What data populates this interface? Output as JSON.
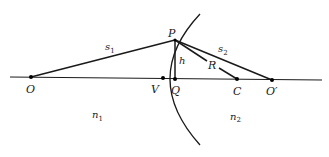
{
  "diagram": {
    "points": {
      "O": {
        "label": "O",
        "x": 31,
        "y": 77
      },
      "V": {
        "label": "V",
        "x": 163,
        "y": 78
      },
      "Q": {
        "label": "Q",
        "x": 175,
        "y": 79
      },
      "C": {
        "label": "C",
        "x": 237,
        "y": 79
      },
      "Oprime": {
        "label": "O′",
        "x": 272,
        "y": 80
      },
      "P": {
        "label": "P",
        "x": 175,
        "y": 40
      }
    },
    "segments": {
      "s1": {
        "label": "s",
        "sub": "1"
      },
      "s2": {
        "label": "s",
        "sub": "2"
      },
      "h": {
        "label": "h"
      },
      "R": {
        "label": "R"
      }
    },
    "media": {
      "n1": {
        "label": "n",
        "sub": "1"
      },
      "n2": {
        "label": "n",
        "sub": "2"
      }
    },
    "colors": {
      "line": "#1a1a1a",
      "background": "#ffffff"
    }
  }
}
